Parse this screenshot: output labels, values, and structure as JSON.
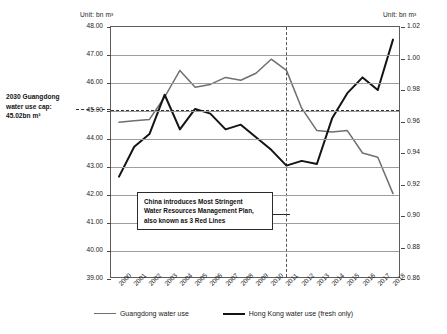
{
  "units": {
    "left": "Unit: bn m³",
    "right": "Unit: bn m³"
  },
  "cap_note": "2030 Guangdong water use cap: 45.02bn m³",
  "annotation": {
    "line1": "China introduces Most Stringent",
    "line2": "Water Resources Management Plan,",
    "line3": "also known as 3 Red Lines"
  },
  "legend": [
    {
      "label": "Guangdong water use",
      "color": "#6f6f6f"
    },
    {
      "label": "Hong Kong water use (fresh only)",
      "color": "#141414"
    }
  ],
  "chart_data": {
    "type": "line",
    "title": "",
    "xlabel": "",
    "ylabel": "Unit: bn m³",
    "y2label": "Unit: bn m³",
    "grid": true,
    "legend_position": "bottom",
    "x": [
      "2000",
      "2001",
      "2002",
      "2003",
      "2004",
      "2005",
      "2006",
      "2007",
      "2008",
      "2009",
      "2010",
      "2011",
      "2012",
      "2013",
      "2014",
      "2015",
      "2016",
      "2017",
      "2018"
    ],
    "ylim": [
      39.0,
      48.0
    ],
    "yticks": [
      "48.00",
      "47.00",
      "46.00",
      "45.00",
      "44.00",
      "43.00",
      "42.00",
      "41.00",
      "40.00",
      "39.00"
    ],
    "y2lim": [
      0.86,
      1.02
    ],
    "y2ticks": [
      "1.02",
      "1.00",
      "0.98",
      "0.96",
      "0.94",
      "0.92",
      "0.90",
      "0.88",
      "0.86"
    ],
    "series": [
      {
        "name": "Guangdong water use",
        "axis": "left",
        "color": "#6f6f6f",
        "values": [
          44.6,
          44.65,
          44.7,
          45.5,
          46.45,
          45.85,
          45.95,
          46.2,
          46.1,
          46.35,
          46.85,
          46.45,
          45.1,
          44.3,
          44.25,
          44.3,
          43.5,
          43.35,
          42.05
        ]
      },
      {
        "name": "Hong Kong water use (fresh only)",
        "axis": "right",
        "color": "#141414",
        "values": [
          0.925,
          0.944,
          0.952,
          0.977,
          0.955,
          0.968,
          0.965,
          0.955,
          0.958,
          0.95,
          0.942,
          0.932,
          0.935,
          0.933,
          0.962,
          0.978,
          0.988,
          0.98,
          1.012
        ]
      }
    ],
    "reference_line": {
      "label": "2030 Guangdong water use cap: 45.02bn m³",
      "value": 45.02,
      "axis": "left",
      "style": "dashed"
    },
    "vertical_marker": {
      "x": "2011",
      "style": "dashed"
    }
  }
}
